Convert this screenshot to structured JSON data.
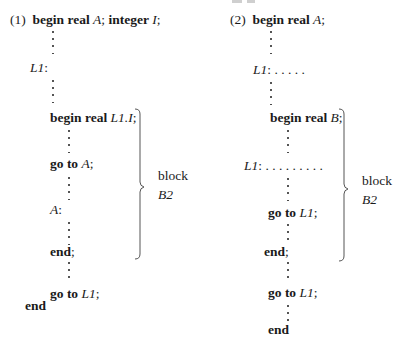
{
  "figure": {
    "clipped_top_fragment": "",
    "example_1": {
      "number": "(1)",
      "lines": {
        "begin": "begin",
        "real": "real",
        "A": "A",
        "semi1": ";",
        "integer": "integer",
        "I": "I",
        "semi2": ";",
        "L1_label": "L1",
        "colon": ":",
        "inner_begin": "begin",
        "inner_real": "real",
        "inner_var": "L1.I",
        "inner_semi": ";",
        "goto1_kw": "go to",
        "goto1_target": "A",
        "goto1_semi": ";",
        "A_label": "A",
        "A_colon": ":",
        "inner_end": "end",
        "inner_end_semi": ";",
        "goto2_kw": "go to",
        "goto2_target": "L1",
        "goto2_semi": ";",
        "outer_end": "end"
      },
      "brace_label": {
        "line1": "block",
        "line2": "B2"
      }
    },
    "example_2": {
      "number": "(2)",
      "lines": {
        "begin": "begin",
        "real": "real",
        "A": "A",
        "semi1": ";",
        "L1_label": "L1",
        "L1_colon_dots": ": . . . . .",
        "inner_begin": "begin",
        "inner_real": "real",
        "inner_var": "B",
        "inner_semi": ";",
        "inner_L1_label": "L1",
        "inner_L1_colon_dots": ": . . . . . . . . .",
        "goto1_kw": "go to",
        "goto1_target": "L1",
        "goto1_semi": ";",
        "inner_end": "end",
        "inner_end_semi": ";",
        "goto2_kw": "go to",
        "goto2_target": "L1",
        "goto2_semi": ";",
        "outer_end": "end"
      },
      "brace_label": {
        "line1": "block",
        "line2": "B2"
      }
    }
  }
}
